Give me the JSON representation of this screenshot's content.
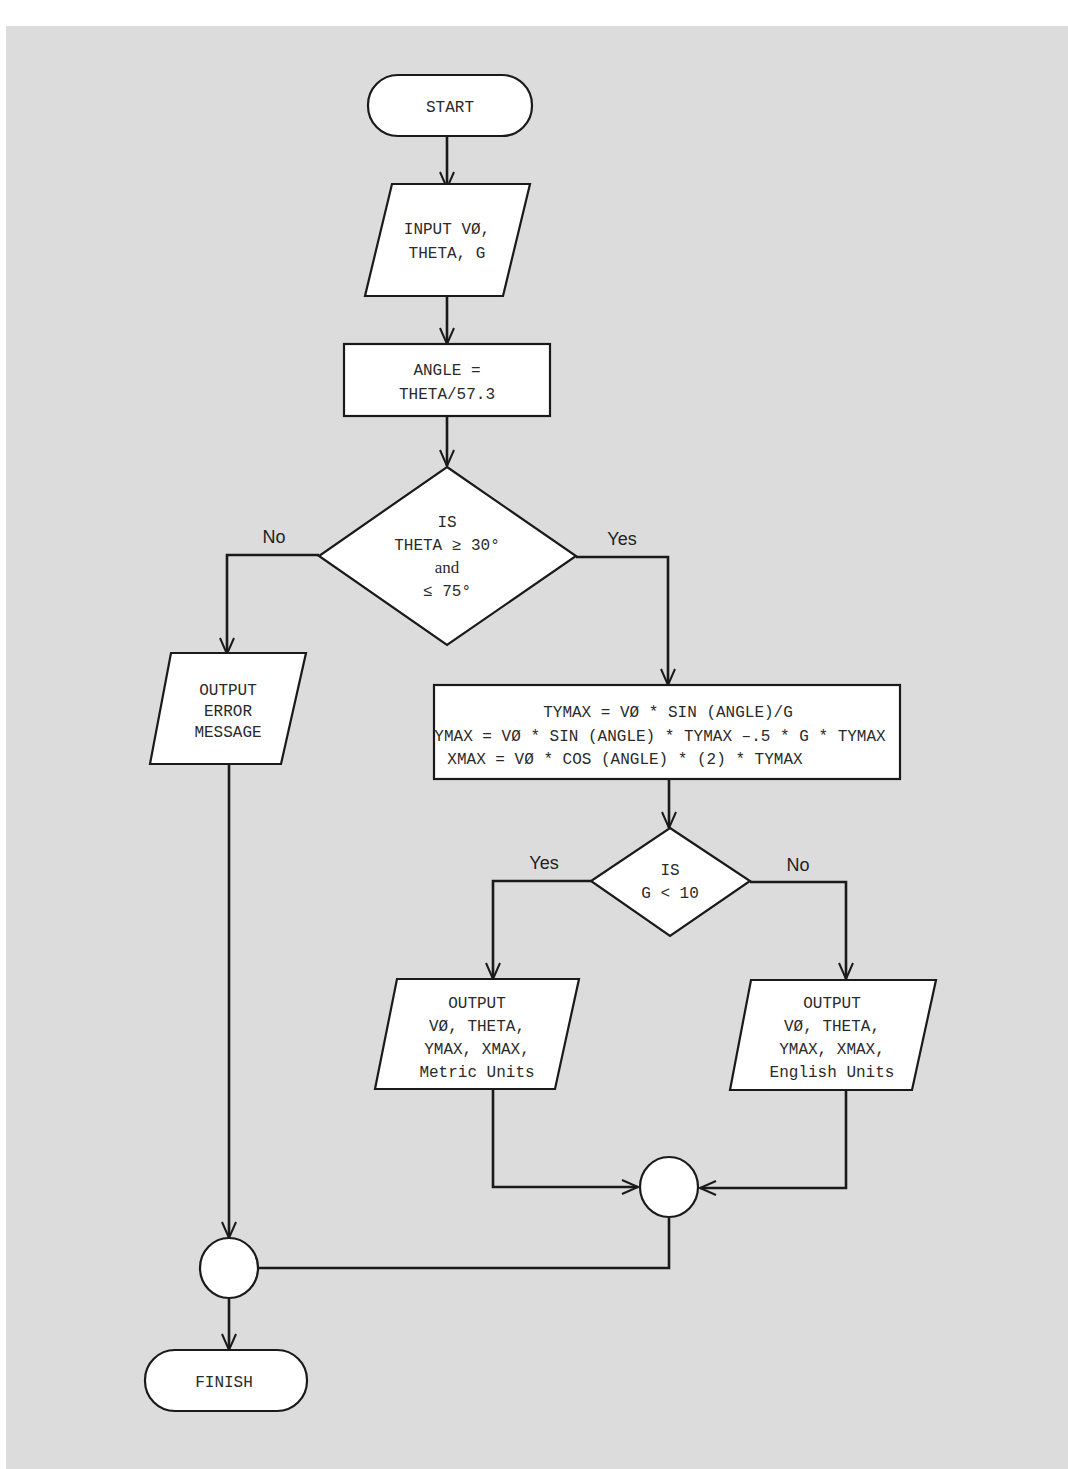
{
  "flowchart": {
    "nodes": {
      "start": {
        "type": "terminal",
        "lines": [
          "START"
        ]
      },
      "input": {
        "type": "io",
        "lines": [
          "INPUT VØ,",
          "THETA, G"
        ]
      },
      "angle": {
        "type": "process",
        "lines": [
          "ANGLE =",
          "THETA/57.3"
        ]
      },
      "decision1": {
        "type": "decision",
        "lines": [
          "IS",
          "THETA ≥ 30°",
          "and",
          "≤ 75°"
        ]
      },
      "error": {
        "type": "io",
        "lines": [
          "OUTPUT",
          "ERROR",
          "MESSAGE"
        ]
      },
      "compute": {
        "type": "process",
        "lines": [
          "TYMAX = VØ * SIN (ANGLE)/G",
          "YMAX = VØ * SIN (ANGLE) * TYMAX –.5 * G * TYMAX",
          "XMAX = VØ * COS (ANGLE) * (2) * TYMAX"
        ]
      },
      "decision2": {
        "type": "decision",
        "lines": [
          "IS",
          "G < 10"
        ]
      },
      "metric": {
        "type": "io",
        "lines": [
          "OUTPUT",
          "VØ, THETA,",
          "YMAX, XMAX,",
          "Metric Units"
        ]
      },
      "english": {
        "type": "io",
        "lines": [
          "OUTPUT",
          "VØ, THETA,",
          "YMAX, XMAX,",
          "English Units"
        ]
      },
      "connector1": {
        "type": "connector",
        "lines": []
      },
      "connector2": {
        "type": "connector",
        "lines": []
      },
      "finish": {
        "type": "terminal",
        "lines": [
          "FINISH"
        ]
      }
    },
    "edge_labels": {
      "d1_no": "No",
      "d1_yes": "Yes",
      "d2_yes": "Yes",
      "d2_no": "No"
    },
    "colors": {
      "background": "#dcdcdc",
      "shape_fill": "#ffffff",
      "stroke": "#1a1a1a"
    }
  }
}
